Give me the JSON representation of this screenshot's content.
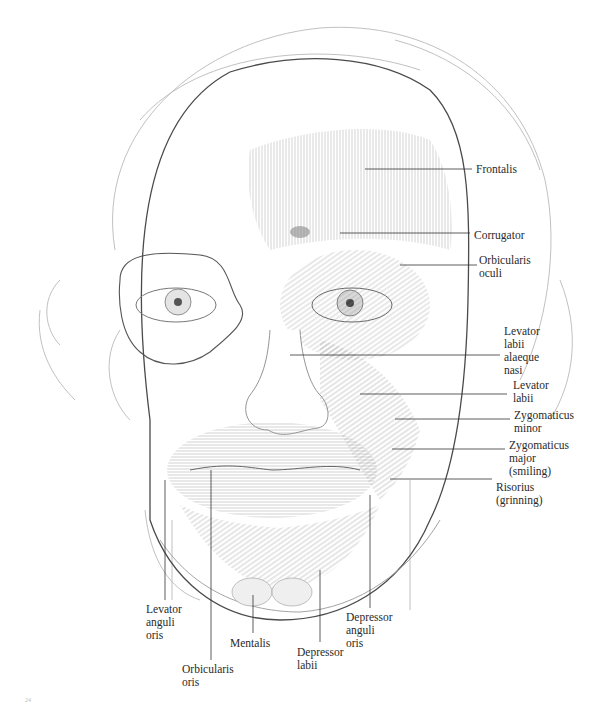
{
  "figure": {
    "labels_right": [
      {
        "id": "frontalis",
        "text": "Frontalis",
        "x": 476,
        "y": 163
      },
      {
        "id": "corrugator",
        "text": "Corrugator",
        "x": 474,
        "y": 229
      },
      {
        "id": "orbicularis-oculi",
        "text": "Orbicularis\noculi",
        "x": 479,
        "y": 254
      },
      {
        "id": "levator-labii-alaeque-nasi",
        "text": "Levator\nlabii\nalaeque\nnasi",
        "x": 504,
        "y": 325
      },
      {
        "id": "levator-labii",
        "text": "Levator\nlabii",
        "x": 513,
        "y": 379
      },
      {
        "id": "zygomaticus-minor",
        "text": "Zygomaticus\nminor",
        "x": 514,
        "y": 409
      },
      {
        "id": "zygomaticus-major",
        "text": "Zygomaticus\nmajor\n(smiling)",
        "x": 509,
        "y": 439
      },
      {
        "id": "risorius",
        "text": "Risorius\n(grinning)",
        "x": 496,
        "y": 481
      }
    ],
    "labels_bottom": [
      {
        "id": "levator-anguli-oris",
        "text": "Levator\nanguli\noris",
        "x": 146,
        "y": 603
      },
      {
        "id": "orbicularis-oris",
        "text": "Orbicularis\noris",
        "x": 182,
        "y": 663
      },
      {
        "id": "mentalis",
        "text": "Mentalis",
        "x": 230,
        "y": 637
      },
      {
        "id": "depressor-labii",
        "text": "Depressor\nlabii",
        "x": 297,
        "y": 646
      },
      {
        "id": "depressor-anguli-oris",
        "text": "Depressor\nanguli\noris",
        "x": 346,
        "y": 611
      }
    ],
    "page_number": "24"
  }
}
